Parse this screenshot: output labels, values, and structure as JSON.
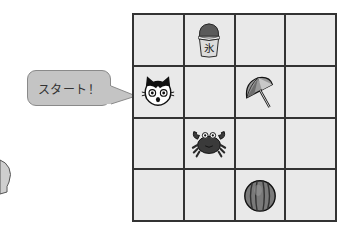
{
  "speech_bubble": {
    "text": "スタート！"
  },
  "board": {
    "rows": 4,
    "cols": 4,
    "cells": [
      [
        "",
        "shaved-ice",
        "",
        ""
      ],
      [
        "cat",
        "",
        "parasol",
        ""
      ],
      [
        "",
        "crab",
        "",
        ""
      ],
      [
        "",
        "",
        "watermelon",
        ""
      ]
    ]
  },
  "colors": {
    "cell_bg": "#e9e9e9",
    "grid_line": "#333333",
    "bubble_fill": "#c4c4c4",
    "bubble_border": "#8a8a8a"
  }
}
